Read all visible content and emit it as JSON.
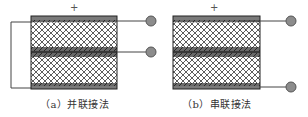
{
  "figure": {
    "panels": [
      {
        "id": "a",
        "caption": "（a）并联接法",
        "plus_label": "+",
        "connection": "parallel",
        "terminals": 2
      },
      {
        "id": "b",
        "caption": "（b）串联接法",
        "plus_label": "+",
        "connection": "series",
        "terminals": 2
      }
    ],
    "colors": {
      "electrode": "#7a7a7a",
      "mesh_line": "#333333",
      "mesh_bg": "#ffffff",
      "middle_layer": "#555555",
      "terminal_fill": "#8c8c8c",
      "terminal_stroke": "#555555",
      "wire": "#444444"
    }
  }
}
